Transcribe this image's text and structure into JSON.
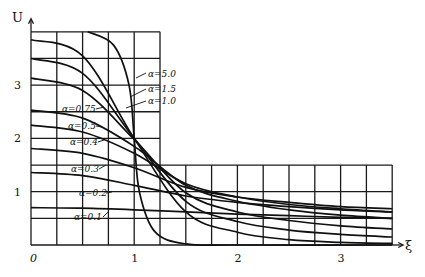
{
  "chart_data": {
    "type": "line",
    "title": "",
    "xlabel": "ξ",
    "ylabel": "U",
    "xlim": [
      0,
      3.5
    ],
    "ylim": [
      0,
      4
    ],
    "x_ticks": [
      "0",
      "1",
      "2",
      "3"
    ],
    "y_ticks": [
      "1",
      "2",
      "3"
    ],
    "grid": {
      "on": true,
      "x_step": 0.25,
      "y_step": 0.5,
      "upper_region": {
        "xmax": 1.25,
        "ymax": 4
      },
      "lower_region": {
        "xmax": 3.5,
        "ymax": 1.5
      }
    },
    "legend": "inline labels",
    "series": [
      {
        "name": "α=0.1",
        "label": "α=0.1",
        "x": [
          0,
          0.5,
          1.0,
          1.5,
          2.0,
          2.5,
          3.0,
          3.5
        ],
        "y": [
          0.7,
          0.69,
          0.66,
          0.62,
          0.58,
          0.55,
          0.52,
          0.5
        ]
      },
      {
        "name": "α=0.2",
        "label": "α=0.2",
        "x": [
          0,
          0.5,
          1.0,
          1.5,
          2.0,
          2.5,
          3.0,
          3.5
        ],
        "y": [
          1.36,
          1.3,
          1.12,
          0.92,
          0.8,
          0.72,
          0.66,
          0.62
        ]
      },
      {
        "name": "α=0.3",
        "label": "α=0.3",
        "x": [
          0,
          0.5,
          1.0,
          1.5,
          2.0,
          2.5,
          3.0,
          3.5
        ],
        "y": [
          1.81,
          1.72,
          1.45,
          1.08,
          0.9,
          0.8,
          0.72,
          0.68
        ]
      },
      {
        "name": "α=0.4",
        "label": "α=0.4",
        "x": [
          0,
          0.5,
          1.0,
          1.5,
          2.0,
          2.5,
          3.0,
          3.5
        ],
        "y": [
          2.25,
          2.12,
          1.72,
          1.15,
          0.9,
          0.76,
          0.68,
          0.62
        ]
      },
      {
        "name": "α=0.5",
        "label": "α=0.5",
        "x": [
          0,
          0.5,
          1.0,
          1.5,
          2.0,
          2.5,
          3.0,
          3.5
        ],
        "y": [
          2.53,
          2.38,
          1.85,
          1.12,
          0.82,
          0.66,
          0.56,
          0.5
        ]
      },
      {
        "name": "α=0.75",
        "label": "α=0.75",
        "x": [
          0,
          0.5,
          1.0,
          1.5,
          2.0,
          2.5,
          3.0,
          3.5
        ],
        "y": [
          3.13,
          2.9,
          1.98,
          0.98,
          0.62,
          0.46,
          0.36,
          0.3
        ]
      },
      {
        "name": "α=1.0",
        "label": "α=1.0",
        "x": [
          0,
          0.5,
          1.0,
          1.5,
          2.0,
          2.5,
          3.0,
          3.5
        ],
        "y": [
          3.5,
          3.22,
          2.0,
          0.82,
          0.44,
          0.28,
          0.2,
          0.15
        ]
      },
      {
        "name": "α=1.5",
        "label": "α=1.5",
        "x": [
          0,
          0.5,
          1.0,
          1.5,
          2.0,
          2.5,
          3.0,
          3.5
        ],
        "y": [
          3.85,
          3.55,
          2.0,
          0.62,
          0.24,
          0.1,
          0.05,
          0.03
        ]
      },
      {
        "name": "α=5.0",
        "label": "α=5.0",
        "x": [
          0.55,
          0.8,
          0.95,
          1.0,
          1.05,
          1.2,
          1.5,
          2.0,
          3.5
        ],
        "y": [
          4.0,
          3.75,
          3.0,
          2.0,
          1.0,
          0.25,
          0.02,
          0.0,
          0.0
        ]
      }
    ],
    "annotations": [
      "α=5.0",
      "α=1.5",
      "α=1.0",
      "α=0.75",
      "α=0.5",
      "α=0.4",
      "α=0.3",
      "α=0.2",
      "α=0.1"
    ]
  },
  "labels": {
    "y_axis": "U",
    "x_axis": "ξ",
    "origin": "0"
  }
}
